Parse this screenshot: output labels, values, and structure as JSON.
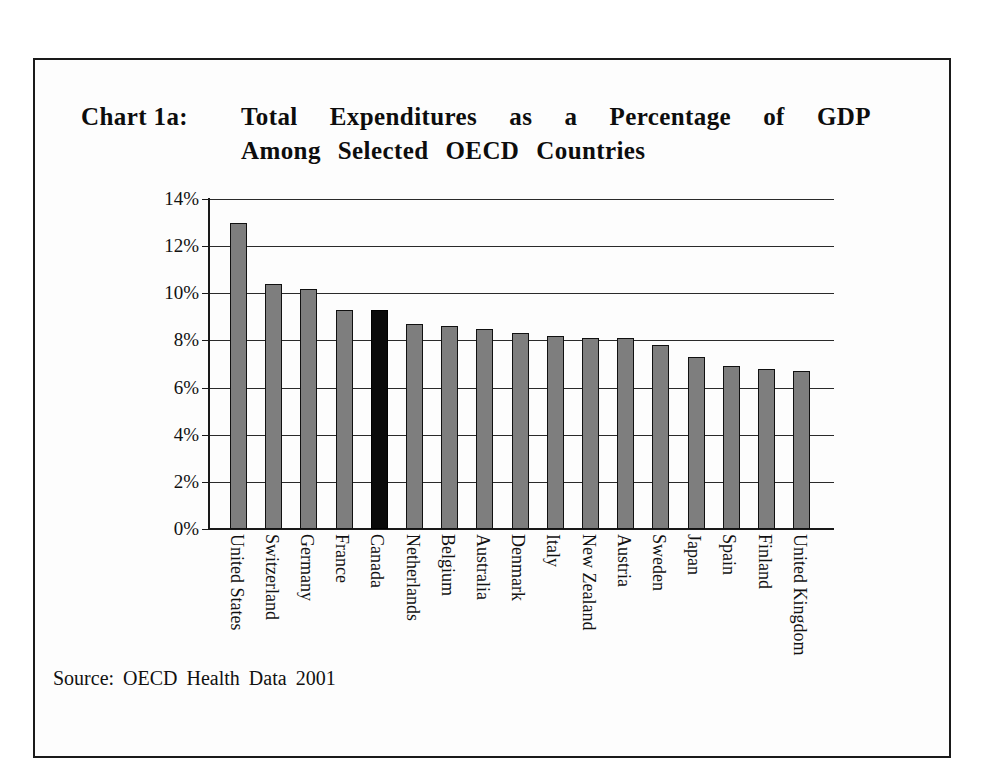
{
  "title": {
    "label": "Chart 1a:",
    "line1_words": [
      "Total",
      "Expenditures",
      "as",
      "a",
      "Percentage",
      "of",
      "GDP"
    ],
    "line2_words": [
      "Among",
      "Selected",
      "OECD",
      "Countries"
    ],
    "line1": "Total Expenditures as a Percentage of GDP",
    "line2": "Among Selected OECD Countries",
    "full": "Chart 1a: Total Expenditures as a Percentage of GDP Among Selected OECD Countries"
  },
  "source": {
    "words": [
      "Source:",
      "OECD",
      "Health",
      "Data",
      "2001"
    ],
    "text": "Source: OECD Health Data 2001"
  },
  "colors": {
    "bar_fill": "#7e7e7e",
    "bar_stroke": "#111111",
    "highlight_fill": "#0a0a0a",
    "grid": "#2a2a2a",
    "axis": "#1a1a1a",
    "frame": "#1a1a1a",
    "background": "#fdfdfd",
    "text": "#111111"
  },
  "chart_data": {
    "type": "bar",
    "subtitle": "",
    "xlabel": "",
    "ylabel": "",
    "ylim": [
      0,
      14
    ],
    "ytick_values": [
      0,
      2,
      4,
      6,
      8,
      10,
      12,
      14
    ],
    "ytick_labels": [
      "0%",
      "2%",
      "4%",
      "6%",
      "8%",
      "10%",
      "12%",
      "14%"
    ],
    "grid": true,
    "legend": false,
    "legend_position": "none",
    "highlight_category": "Canada",
    "units": "percent of GDP",
    "categories": [
      "United States",
      "Switzerland",
      "Germany",
      "France",
      "Canada",
      "Netherlands",
      "Belgium",
      "Australia",
      "Denmark",
      "Italy",
      "New Zealand",
      "Austria",
      "Sweden",
      "Japan",
      "Spain",
      "Finland",
      "United Kingdom"
    ],
    "values": [
      13.0,
      10.4,
      10.2,
      9.3,
      9.3,
      8.7,
      8.6,
      8.5,
      8.3,
      8.2,
      8.1,
      8.1,
      7.8,
      7.3,
      6.9,
      6.8,
      6.7
    ]
  }
}
